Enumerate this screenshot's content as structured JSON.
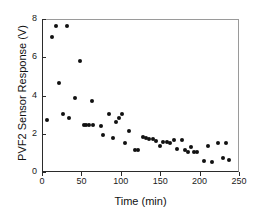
{
  "chart_data": {
    "type": "scatter",
    "title": "",
    "xlabel": "Time (min)",
    "ylabel": "PVF2 Sensor Response (V)",
    "xlim": [
      0,
      250
    ],
    "ylim": [
      0,
      8
    ],
    "xticks": [
      0,
      50,
      100,
      150,
      200,
      250
    ],
    "yticks": [
      0,
      2,
      4,
      6,
      8
    ],
    "grid": false,
    "legend": null,
    "marker": "filled-circle",
    "marker_color": "#111111",
    "series": [
      {
        "name": "PVF2 sensor response",
        "points": [
          [
            5,
            2.78
          ],
          [
            12,
            7.12
          ],
          [
            16,
            7.7
          ],
          [
            20,
            4.73
          ],
          [
            25,
            3.1
          ],
          [
            30,
            7.7
          ],
          [
            33,
            2.87
          ],
          [
            41,
            3.93
          ],
          [
            47,
            5.88
          ],
          [
            52,
            2.5
          ],
          [
            55,
            2.5
          ],
          [
            59,
            2.53
          ],
          [
            62,
            3.78
          ],
          [
            64,
            2.53
          ],
          [
            73,
            2.48
          ],
          [
            76,
            2.0
          ],
          [
            84,
            3.1
          ],
          [
            89,
            1.82
          ],
          [
            93,
            2.66
          ],
          [
            96,
            2.88
          ],
          [
            100,
            3.07
          ],
          [
            104,
            1.56
          ],
          [
            109,
            2.18
          ],
          [
            117,
            1.18
          ],
          [
            121,
            1.18
          ],
          [
            127,
            1.9
          ],
          [
            131,
            1.85
          ],
          [
            135,
            1.77
          ],
          [
            139,
            1.8
          ],
          [
            143,
            1.68
          ],
          [
            148,
            1.4
          ],
          [
            152,
            1.62
          ],
          [
            157,
            1.62
          ],
          [
            161,
            1.58
          ],
          [
            166,
            1.72
          ],
          [
            170,
            1.27
          ],
          [
            176,
            1.7
          ],
          [
            180,
            1.22
          ],
          [
            184,
            1.1
          ],
          [
            188,
            1.35
          ],
          [
            192,
            1.12
          ],
          [
            196,
            1.08
          ],
          [
            204,
            0.62
          ],
          [
            209,
            1.43
          ],
          [
            215,
            0.57
          ],
          [
            222,
            1.55
          ],
          [
            229,
            0.8
          ],
          [
            232,
            1.55
          ],
          [
            236,
            0.68
          ]
        ]
      }
    ]
  }
}
